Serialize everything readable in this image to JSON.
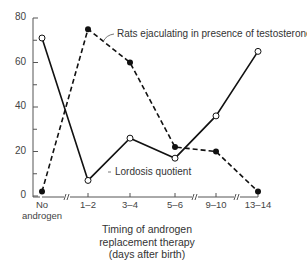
{
  "chart_data": {
    "type": "line",
    "title": "",
    "xlabel": "Timing of androgen replacement therapy (days after birth)",
    "xlabel_lines": [
      "Timing of androgen",
      "replacement therapy",
      "(days after birth)"
    ],
    "ylabel": "",
    "ylim": [
      0,
      80
    ],
    "yticks": [
      0,
      20,
      40,
      60,
      80
    ],
    "grid": false,
    "categories": [
      "No androgen",
      "1–2",
      "3–4",
      "5–6",
      "9–10",
      "13–14"
    ],
    "category_lines": [
      [
        "No",
        "androgen"
      ],
      [
        "1–2"
      ],
      [
        "3–4"
      ],
      [
        "5–6"
      ],
      [
        "9–10"
      ],
      [
        "13–14"
      ]
    ],
    "axis_breaks_between": [
      [
        "No androgen",
        "1–2"
      ],
      [
        "5–6",
        "9–10"
      ],
      [
        "9–10",
        "13–14"
      ]
    ],
    "series": [
      {
        "name": "Rats ejaculating in presence of testosterone",
        "style": "dashed",
        "marker": "filled-circle",
        "values": [
          2,
          75,
          60,
          22,
          20,
          2
        ]
      },
      {
        "name": "Lordosis quotient",
        "style": "solid",
        "marker": "open-circle",
        "values": [
          71,
          7,
          26,
          17,
          36,
          65
        ]
      }
    ],
    "legend": "inline-annotations"
  },
  "colors": {
    "line": "#111111",
    "axis": "#555555",
    "background": "#ffffff"
  }
}
